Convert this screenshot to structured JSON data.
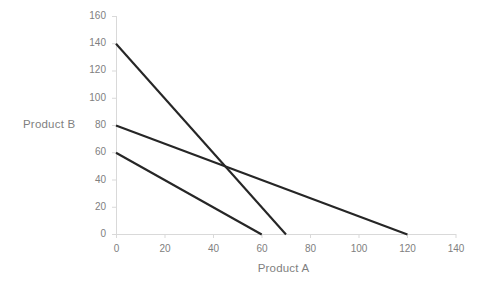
{
  "chart_data": {
    "type": "line",
    "title": "",
    "subtitle": "",
    "xlabel": "Product A",
    "ylabel": "Product B",
    "xlim": [
      0,
      140
    ],
    "ylim": [
      0,
      160
    ],
    "xticks": [
      0,
      20,
      40,
      60,
      80,
      100,
      120,
      140
    ],
    "yticks": [
      0,
      20,
      40,
      60,
      80,
      100,
      120,
      140,
      160
    ],
    "xtick_labels": [
      "0",
      "20",
      "40",
      "60",
      "80",
      "100",
      "120",
      "140"
    ],
    "ytick_labels": [
      "0",
      "20",
      "40",
      "60",
      "80",
      "100",
      "120",
      "140",
      "160"
    ],
    "grid": false,
    "legend": "none",
    "line_color": "#262626",
    "axis_color": "#d9d9d9",
    "tick_label_color": "#808080",
    "axis_label_color": "#7f7f7f",
    "background_color": "#ffffff",
    "series": [
      {
        "name": "constraint-1",
        "x": [
          0,
          70
        ],
        "y": [
          140,
          0
        ],
        "color": "#262626"
      },
      {
        "name": "constraint-2",
        "x": [
          0,
          120
        ],
        "y": [
          80,
          0
        ],
        "color": "#262626"
      },
      {
        "name": "constraint-3",
        "x": [
          0,
          60
        ],
        "y": [
          60,
          0
        ],
        "color": "#262626"
      }
    ],
    "annotations": []
  }
}
